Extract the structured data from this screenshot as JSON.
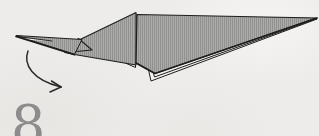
{
  "step": {
    "number": "8",
    "color": "#8c8c8c"
  },
  "diagram": {
    "kind": "origami-fold-step",
    "canvas": {
      "width": 319,
      "height": 136
    },
    "colors": {
      "paper_fill": "#acacaa",
      "paper_stripe": "#8e8e8c",
      "underside": "#f3f2f0",
      "outline": "#1e1e1e",
      "arrow": "#2b2b2b"
    },
    "shapes": [
      {
        "name": "rear-layer-2",
        "role": "under",
        "points": "137,18 317,19 151,81",
        "stroke_width": 1
      },
      {
        "name": "rear-layer-1",
        "role": "under",
        "points": "137,16 317,18.5 154.5,77",
        "stroke_width": 1
      },
      {
        "name": "middle-flap-underlayer",
        "role": "under",
        "points": "136,14 79.5,42.5 135.5,67.5",
        "stroke_width": 1
      },
      {
        "name": "middle-flap",
        "role": "paper",
        "points": "136,12.5 79,40 65,52.5 74.5,54.5 136,65",
        "stroke_width": 1.1
      },
      {
        "name": "junction-flap",
        "role": "paper",
        "points": "78.5,38.5 65,52.5 92,50",
        "stroke_width": 1.1
      },
      {
        "name": "nose-flap",
        "role": "paper",
        "points": "16,35.5 82,39.5 74.5,54.5",
        "stroke_width": 1
      },
      {
        "name": "nose-slit",
        "role": "under-noline",
        "points": "17,37.2 52,41.2 17,39",
        "stroke_width": 0
      },
      {
        "name": "main-wing",
        "role": "paper",
        "points": "137,14.5 317,18 155,73.5 136,63",
        "stroke_width": 1.2
      }
    ],
    "edges": [
      {
        "name": "nose-slit-line",
        "d": "M 17 36.4 L 52 41",
        "stroke_width": 0.9
      },
      {
        "name": "nose-bottom-edge",
        "d": "M 16 36.3 L 74.5 54.7",
        "stroke_width": 1.8
      },
      {
        "name": "wing-bottom-edge",
        "d": "M 317 18 L 155 73.5 L 136 63",
        "stroke_width": 1.7
      }
    ],
    "fold_arrow": {
      "name": "fold-direction-arrow",
      "direction": "down-right",
      "path": "M 28 51 C 23 64 32 80 61 87",
      "barbs": [
        "M 61 87 L 51.5 81",
        "M 61 87 L 50 92"
      ],
      "stroke_width": 1.5
    }
  }
}
